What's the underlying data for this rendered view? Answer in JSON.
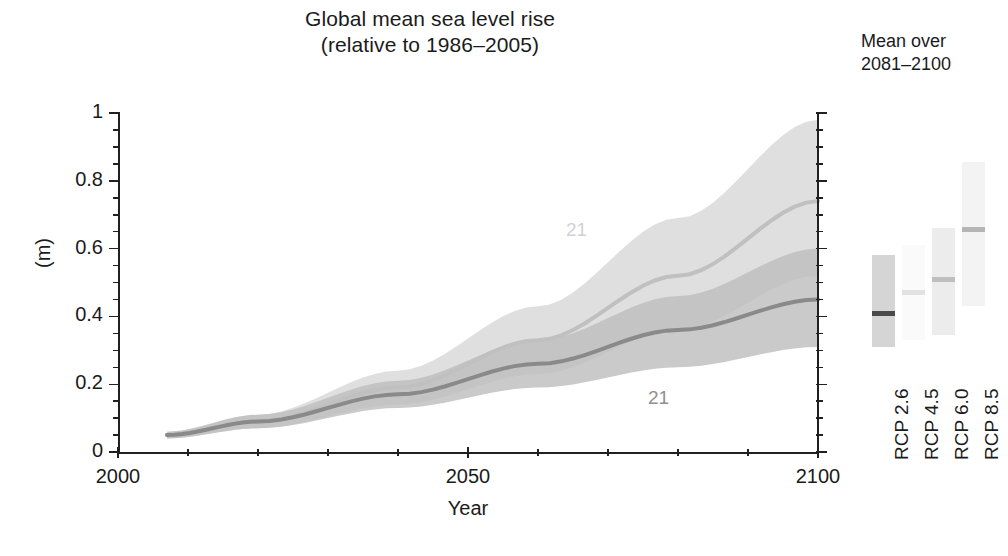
{
  "chart_data": {
    "type": "area",
    "title": "Global mean sea level rise",
    "subtitle": "(relative to 1986–2005)",
    "xlabel": "Year",
    "ylabel": "(m)",
    "xlim": [
      2000,
      2100
    ],
    "ylim": [
      0,
      1.0
    ],
    "x_major_ticks": [
      2000,
      2050,
      2100
    ],
    "x_major_tick_labels": [
      "2000",
      "2050",
      "2100"
    ],
    "x_minor_tick_step": 10,
    "y_major_ticks": [
      0,
      0.2,
      0.4,
      0.6,
      0.8,
      1
    ],
    "y_major_tick_labels": [
      "0",
      "0.2",
      "0.4",
      "0.6",
      "0.8",
      "1"
    ],
    "y_minor_tick_step": 0.05,
    "grid": false,
    "legend_position": "right-panel",
    "series": [
      {
        "name": "RCP 8.5",
        "color": "#d9d9d9",
        "line_color": "#c0c0c0",
        "in_plot_label": "21",
        "x": [
          2007,
          2020,
          2040,
          2060,
          2080,
          2100
        ],
        "mean": [
          0.05,
          0.09,
          0.19,
          0.33,
          0.52,
          0.74
        ],
        "lower": [
          0.04,
          0.07,
          0.14,
          0.23,
          0.36,
          0.52
        ],
        "upper": [
          0.06,
          0.11,
          0.24,
          0.43,
          0.69,
          0.98
        ]
      },
      {
        "name": "RCP 2.6",
        "color": "#bdbdbd",
        "line_color": "#8a8a8a",
        "in_plot_label": "21",
        "x": [
          2007,
          2020,
          2040,
          2060,
          2080,
          2100
        ],
        "mean": [
          0.05,
          0.09,
          0.17,
          0.26,
          0.36,
          0.45
        ],
        "lower": [
          0.04,
          0.07,
          0.13,
          0.19,
          0.25,
          0.31
        ],
        "upper": [
          0.06,
          0.11,
          0.21,
          0.33,
          0.46,
          0.6
        ]
      }
    ],
    "right_panel": {
      "heading_line1": "Mean over",
      "heading_line2": "2081–2100",
      "bars": [
        {
          "label": "RCP 2.6",
          "low": 0.31,
          "high": 0.58,
          "median": 0.41,
          "fill": "#d5d5d5",
          "median_color": "#4a4a4a"
        },
        {
          "label": "RCP 4.5",
          "low": 0.33,
          "high": 0.61,
          "median": 0.47,
          "fill": "#fafafa",
          "median_color": "#e2e2e2"
        },
        {
          "label": "RCP 6.0",
          "low": 0.345,
          "high": 0.66,
          "median": 0.51,
          "fill": "#ececec",
          "median_color": "#bfbfbf"
        },
        {
          "label": "RCP 8.5",
          "low": 0.43,
          "high": 0.855,
          "median": 0.655,
          "fill": "#f3f3f3",
          "median_color": "#b5b5b5"
        }
      ]
    },
    "annotations": [
      {
        "text": "21",
        "x": 2081,
        "y": 0.645,
        "color": "#d2d2d2"
      },
      {
        "text": "21",
        "x": 2092,
        "y": 0.155,
        "color": "#909090"
      }
    ]
  },
  "title": {
    "line1": "Global mean sea level rise",
    "line2": "(relative to 1986–2005)"
  },
  "axes": {
    "ylabel": "(m)",
    "xlabel": "Year",
    "ytick_labels": [
      "1",
      "0.8",
      "0.6",
      "0.4",
      "0.2",
      "0"
    ],
    "xtick_labels": [
      "2000",
      "2050",
      "2100"
    ]
  },
  "legend": {
    "heading_line1": "Mean over",
    "heading_line2": "2081–2100",
    "bar_labels": [
      "RCP 2.6",
      "RCP 4.5",
      "RCP 6.0",
      "RCP 8.5"
    ]
  },
  "annotations": {
    "upper_band": "21",
    "lower_band": "21"
  },
  "footer": {
    "note": ""
  },
  "colors": {
    "axis": "#202020",
    "text": "#1b1b1b",
    "band_rcp85": "#d9d9d9",
    "band_rcp26": "#bdbdbd",
    "line_rcp85": "#c0c0c0",
    "line_rcp26": "#8a8a8a"
  }
}
